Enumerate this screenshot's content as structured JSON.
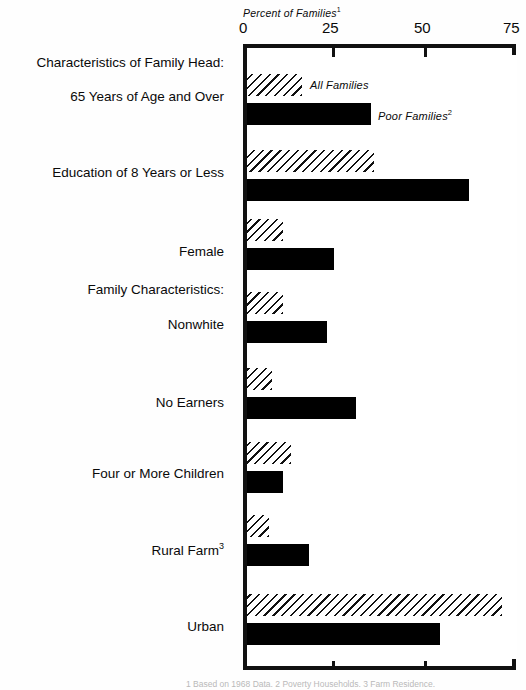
{
  "chart_data": {
    "type": "bar",
    "orientation": "horizontal",
    "title": "Percent of Families",
    "title_footnote_marker": "1",
    "xlabel": "Percent of Families",
    "ylabel": "",
    "xlim": [
      0,
      75
    ],
    "xticks": [
      0,
      25,
      50,
      75
    ],
    "xtick_labels": [
      "0",
      "25",
      "50",
      "75"
    ],
    "grid": false,
    "legend_position": "inline-right-of-first-group",
    "categories": [
      "65 Years of Age and Over",
      "Education of 8 Years or Less",
      "Female",
      "Nonwhite",
      "No Earners",
      "Four or More Children",
      "Rural Farm",
      "Urban"
    ],
    "series": [
      {
        "name": "All Families",
        "fill": "hatched",
        "values": [
          15,
          35,
          10,
          10,
          7,
          12,
          6,
          70
        ]
      },
      {
        "name": "Poor Families",
        "fill": "solid",
        "values": [
          34,
          61,
          24,
          22,
          30,
          10,
          17,
          53
        ]
      }
    ],
    "section_headings": [
      "Characteristics of Family Head:",
      "Family Characteristics:"
    ]
  },
  "axis": {
    "title": "Percent of Families",
    "title_sup": "1",
    "ticks": [
      {
        "label": "0",
        "value": 0
      },
      {
        "label": "25",
        "value": 25
      },
      {
        "label": "50",
        "value": 50
      },
      {
        "label": "75",
        "value": 75
      }
    ]
  },
  "legend": {
    "all_families": "All Families",
    "poor_families": "Poor Families",
    "poor_families_sup": "2"
  },
  "labels": {
    "heading_head": "Characteristics of Family Head:",
    "heading_family": "Family Characteristics:",
    "age65": "65 Years of Age and Over",
    "education": "Education of 8 Years or Less",
    "female": "Female",
    "nonwhite": "Nonwhite",
    "no_earners": "No Earners",
    "four_children": "Four or More Children",
    "rural_farm": "Rural Farm",
    "rural_farm_sup": "3",
    "urban": "Urban"
  },
  "footnote": {
    "text": "1 Based on 1968 Data.  2 Poverty Households.  3 Farm Residence."
  },
  "colors": {
    "ink": "#111111",
    "bar_solid": "#000000",
    "background": "#fefefe"
  }
}
